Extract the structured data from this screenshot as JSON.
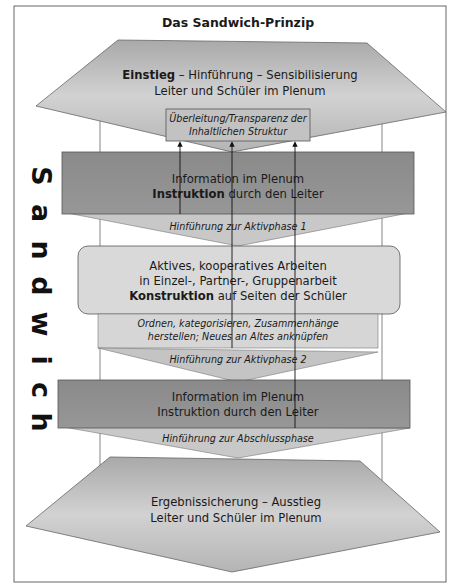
{
  "title": "Das Sandwich-Prinzip",
  "side_label": [
    "S",
    "a",
    "n",
    "d",
    "w",
    "i",
    "c",
    "h"
  ],
  "colors": {
    "pentagon": "#b9b9b9",
    "dark_box": "#8e8e8e",
    "light_box": "#d9d9d9",
    "funnel": "#c4c4c4",
    "border": "#555555",
    "background": "#ffffff"
  },
  "phases": {
    "entry": {
      "line1_bold": "Einstieg",
      "line1_rest": " – Hinführung – Sensibilisierung",
      "line2": "Leiter und Schüler im Plenum"
    },
    "transition_box": {
      "line1": "Überleitung/Transparenz der",
      "line2": "Inhaltlichen Struktur"
    },
    "info1": {
      "line1": "Information im Plenum",
      "line2_bold": "Instruktion",
      "line2_rest": " durch den Leiter"
    },
    "lead_active1": "Hinführung zur Aktivphase 1",
    "active": {
      "line1": "Aktives, kooperatives Arbeiten",
      "line2": "in Einzel-, Partner-, Gruppenarbeit",
      "line3_bold": "Konstruktion",
      "line3_rest": " auf Seiten der Schüler"
    },
    "order": {
      "line1": "Ordnen, kategorisieren, Zusammenhänge",
      "line2": "herstellen; Neues an Altes anknüpfen"
    },
    "lead_active2": "Hinführung zur Aktivphase 2",
    "info2": {
      "line1": "Information im Plenum",
      "line2": "Instruktion durch den Leiter"
    },
    "lead_final": "Hinführung zur Abschlussphase",
    "exit": {
      "line1": "Ergebnissicherung – Ausstieg",
      "line2": "Leiter und Schüler im Plenum"
    }
  }
}
